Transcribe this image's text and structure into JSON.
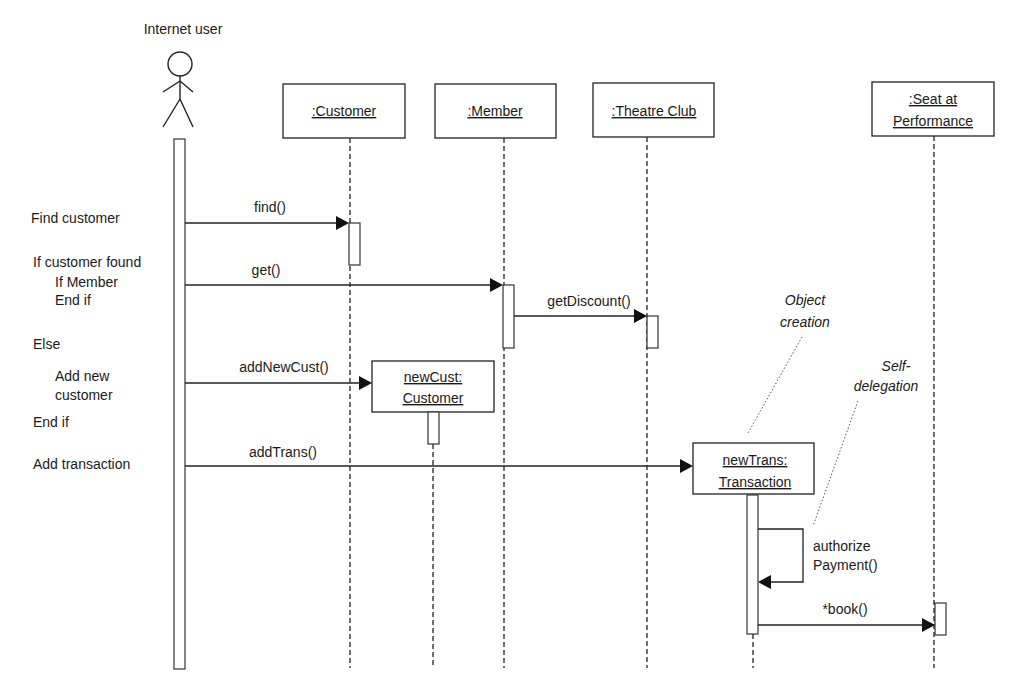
{
  "actor": {
    "label": "Internet user"
  },
  "lifelines": [
    {
      "id": "customer",
      "label": ":Customer"
    },
    {
      "id": "member",
      "label": ":Member"
    },
    {
      "id": "theatre_club",
      "label": ":Theatre Club"
    },
    {
      "id": "seat",
      "label_line1": ":Seat at",
      "label_line2": "Performance"
    }
  ],
  "created_objects": [
    {
      "id": "new_cust",
      "label_line1": "newCust:",
      "label_line2": "Customer"
    },
    {
      "id": "new_trans",
      "label_line1": "newTrans:",
      "label_line2": "Transaction"
    }
  ],
  "messages": [
    {
      "label": "find()",
      "from": "Internet user",
      "to": ":Customer"
    },
    {
      "label": "get()",
      "from": "Internet user",
      "to": ":Member"
    },
    {
      "label": "getDiscount()",
      "from": ":Member",
      "to": ":Theatre Club"
    },
    {
      "label": "addNewCust()",
      "from": "Internet user",
      "to": "newCust:Customer"
    },
    {
      "label": "addTrans()",
      "from": "Internet user",
      "to": "newTrans:Transaction"
    },
    {
      "label_line1": "authorize",
      "label_line2": "Payment()",
      "from": "newTrans:Transaction",
      "to": "newTrans:Transaction"
    },
    {
      "label": "*book()",
      "from": "newTrans:Transaction",
      "to": ":Seat at Performance"
    }
  ],
  "script": [
    {
      "text": "Find customer"
    },
    {
      "text": "If customer found"
    },
    {
      "text": "If Member"
    },
    {
      "text": "End if"
    },
    {
      "text": "Else"
    },
    {
      "text": "Add new"
    },
    {
      "text": "customer"
    },
    {
      "text": "End if"
    },
    {
      "text": "Add transaction"
    }
  ],
  "notes": [
    {
      "line1": "Object",
      "line2": "creation"
    },
    {
      "line1": "Self-",
      "line2": "delegation"
    }
  ]
}
